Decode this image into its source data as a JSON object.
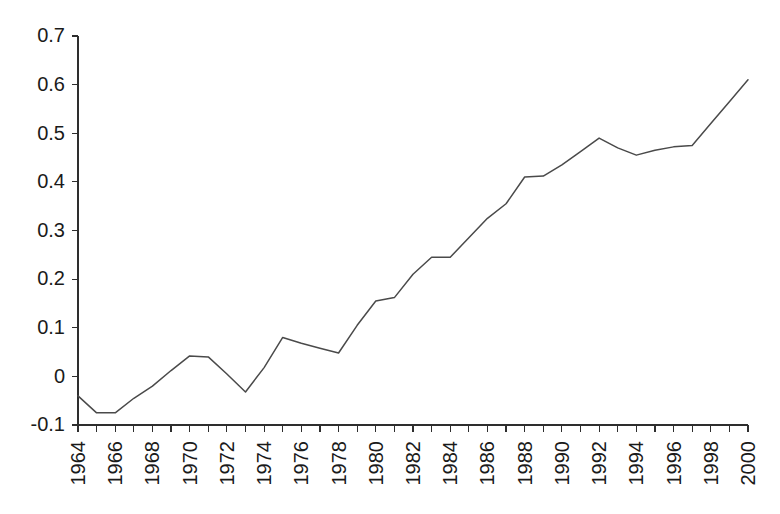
{
  "chart_data": {
    "type": "line",
    "title": "",
    "subtitle": "",
    "xlabel": "",
    "ylabel": "",
    "legend": [],
    "legend_position": "none",
    "grid": false,
    "xlim": [
      1964,
      2000
    ],
    "ylim": [
      -0.1,
      0.7
    ],
    "ytick_values": [
      0.7,
      0.6,
      0.5,
      0.4,
      0.3,
      0.2,
      0.1,
      0,
      -0.1
    ],
    "ytick_labels": [
      "0.7",
      "0.6",
      "0.5",
      "0.4",
      "0.3",
      "0.2",
      "0.1",
      "0",
      "-0.1"
    ],
    "xtick_values": [
      1964,
      1966,
      1968,
      1970,
      1972,
      1974,
      1976,
      1978,
      1980,
      1982,
      1984,
      1986,
      1988,
      1990,
      1992,
      1994,
      1996,
      1998,
      2000
    ],
    "xtick_labels": [
      "1964",
      "1966",
      "1968",
      "1970",
      "1972",
      "1974",
      "1976",
      "1978",
      "1980",
      "1982",
      "1984",
      "1986",
      "1988",
      "1990",
      "1992",
      "1994",
      "1996",
      "1998",
      "2000"
    ],
    "xtick_label_rotation": -90,
    "minor_xticks_every": 1,
    "line_color": "#4a4a4a",
    "x": [
      1964,
      1965,
      1966,
      1967,
      1968,
      1969,
      1970,
      1971,
      1972,
      1973,
      1974,
      1975,
      1976,
      1977,
      1978,
      1979,
      1980,
      1981,
      1982,
      1983,
      1984,
      1985,
      1986,
      1987,
      1988,
      1989,
      1990,
      1991,
      1992,
      1993,
      1994,
      1995,
      1996,
      1997,
      1998,
      1999,
      2000
    ],
    "values": [
      -0.04,
      -0.075,
      -0.075,
      -0.045,
      -0.02,
      0.012,
      0.042,
      0.04,
      0.005,
      -0.032,
      0.018,
      0.08,
      0.068,
      0.058,
      0.048,
      0.105,
      0.155,
      0.162,
      0.21,
      0.245,
      0.245,
      0.285,
      0.325,
      0.355,
      0.41,
      0.412,
      0.435,
      0.462,
      0.49,
      0.47,
      0.455,
      0.465,
      0.472,
      0.475,
      0.52,
      0.565,
      0.61
    ],
    "series": [
      {
        "name": "series-1",
        "values": [
          -0.04,
          -0.075,
          -0.075,
          -0.045,
          -0.02,
          0.012,
          0.042,
          0.04,
          0.005,
          -0.032,
          0.018,
          0.08,
          0.068,
          0.058,
          0.048,
          0.105,
          0.155,
          0.162,
          0.21,
          0.245,
          0.245,
          0.285,
          0.325,
          0.355,
          0.41,
          0.412,
          0.435,
          0.462,
          0.49,
          0.47,
          0.455,
          0.465,
          0.472,
          0.475,
          0.52,
          0.565,
          0.61
        ]
      }
    ]
  }
}
